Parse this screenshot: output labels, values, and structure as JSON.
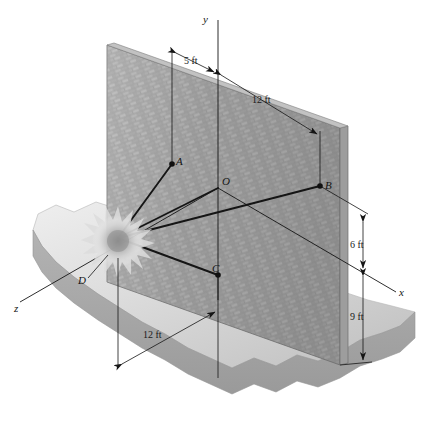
{
  "figure": {
    "kind": "engineering-statics-diagram"
  },
  "axes": {
    "y": {
      "label": "y"
    },
    "x": {
      "label": "x"
    },
    "z": {
      "label": "z"
    }
  },
  "points": [
    {
      "id": "A",
      "label": "A"
    },
    {
      "id": "O",
      "label": "O"
    },
    {
      "id": "B",
      "label": "B"
    },
    {
      "id": "C",
      "label": "C"
    },
    {
      "id": "D",
      "label": "D"
    }
  ],
  "dimensions": [
    {
      "id": "dim-5ft",
      "label": "5 ft"
    },
    {
      "id": "dim-12ft-top",
      "label": "12 ft"
    },
    {
      "id": "dim-6ft",
      "label": "6 ft"
    },
    {
      "id": "dim-9ft",
      "label": "9 ft"
    },
    {
      "id": "dim-12ft-bottom",
      "label": "12 ft"
    }
  ],
  "colors": {
    "line": "#151515",
    "wall_light": "#b4b4b4",
    "wall_dark": "#8d8d8d",
    "wall_edge": "#6f6f6f",
    "ground_top": "#d9d9d9",
    "ground_side": "#a9a9a9",
    "glow_core": "#8f8f8f",
    "background": "#ffffff"
  }
}
